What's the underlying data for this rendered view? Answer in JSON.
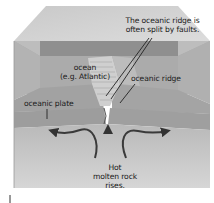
{
  "diagram": {
    "labels": {
      "ocean_line1": "ocean",
      "ocean_line2": "(e.g. Atlantic)",
      "faults_line1": "The oceanic ridge is",
      "faults_line2": "often split by faults.",
      "oceanic_ridge": "oceanic ridge",
      "oceanic_plate": "oceanic plate",
      "hot_line1": "Hot",
      "hot_line2": "molten rock",
      "hot_line3": "rises."
    },
    "colors": {
      "top_surface": "#d4d4d4",
      "ocean_water": "#a9a9a9",
      "ocean_back_band": "#8c8c8c",
      "side_face": "#b8b8b8",
      "plate_crust": "#9c9c9c",
      "mantle": "#c8c8c8",
      "arrow": "#3a3a3a"
    }
  }
}
